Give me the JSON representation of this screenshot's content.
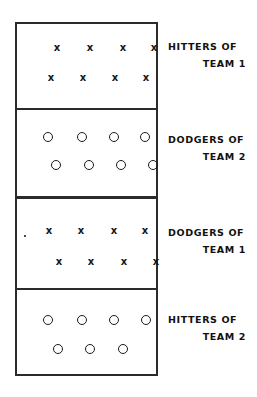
{
  "diagram": {
    "field": {
      "border_color": "#2b2b2b",
      "background_color": "#ffffff"
    },
    "mark_glyphs": {
      "x": "x",
      "o": "o"
    },
    "panels": [
      {
        "id": "panel-1",
        "caption_line1": "HITTERS OF",
        "caption_line2": "TEAM 1",
        "mark_type": "x",
        "rows": [
          {
            "count": 4,
            "positions": [
              42,
              75,
              108,
              139
            ]
          },
          {
            "count": 4,
            "positions": [
              36,
              68,
              100,
              131
            ]
          }
        ]
      },
      {
        "id": "panel-2",
        "caption_line1": "DODGERS OF",
        "caption_line2": "TEAM 2",
        "mark_type": "o",
        "rows": [
          {
            "count": 4,
            "positions": [
              33,
              67,
              99,
              130
            ]
          },
          {
            "count": 4,
            "positions": [
              41,
              74,
              106,
              138
            ]
          }
        ]
      },
      {
        "id": "panel-3",
        "caption_line1": "DODGERS OF",
        "caption_line2": "TEAM 1",
        "mark_type": "x",
        "rows": [
          {
            "count": 4,
            "positions": [
              34,
              66,
              99,
              130
            ]
          },
          {
            "count": 4,
            "positions": [
              44,
              76,
              109,
              141
            ]
          }
        ]
      },
      {
        "id": "panel-4",
        "caption_line1": "HITTERS OF",
        "caption_line2": "TEAM 2",
        "mark_type": "o",
        "rows": [
          {
            "count": 4,
            "positions": [
              33,
              67,
              99,
              131
            ]
          },
          {
            "count": 3,
            "positions": [
              43,
              75,
              108
            ]
          }
        ]
      }
    ]
  }
}
